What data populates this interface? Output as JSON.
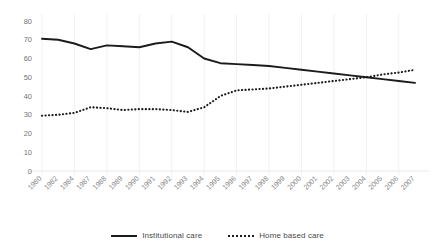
{
  "chart_data": {
    "type": "line",
    "title": "",
    "xlabel": "",
    "ylabel": "",
    "ylim": [
      0,
      80
    ],
    "ytick_step": 10,
    "yticks": [
      "80",
      "70",
      "60",
      "50",
      "40",
      "30",
      "20",
      "10",
      "0"
    ],
    "grid": "vertical-only",
    "legend_position": "bottom-center",
    "categories": [
      "1980",
      "1982",
      "1984",
      "1987",
      "1988",
      "1989",
      "1990",
      "1991",
      "1992",
      "1993",
      "1994",
      "1995",
      "1996",
      "1997",
      "1998",
      "1999",
      "2000",
      "2001",
      "2002",
      "2003",
      "2004",
      "2005",
      "2006",
      "2007"
    ],
    "series": [
      {
        "name": "Institutional care",
        "style": "solid",
        "color": "#1b1b1b",
        "values": [
          70.5,
          70.0,
          68.0,
          65.0,
          67.0,
          66.5,
          66.0,
          68.0,
          69.0,
          66.0,
          60.0,
          57.5,
          57.0,
          56.5,
          56.0,
          55.0,
          54.0,
          53.0,
          52.0,
          51.0,
          50.0,
          49.0,
          48.0,
          47.0
        ]
      },
      {
        "name": "Home based care",
        "style": "dotted",
        "color": "#1b1b1b",
        "values": [
          29.5,
          30.0,
          31.0,
          34.0,
          33.5,
          32.5,
          33.0,
          33.0,
          32.5,
          31.5,
          34.0,
          40.0,
          43.0,
          43.5,
          44.0,
          45.0,
          46.0,
          47.0,
          48.0,
          49.0,
          50.0,
          51.5,
          52.5,
          54.0
        ]
      }
    ]
  },
  "legend": {
    "items": [
      {
        "label": "Institutional care",
        "marker": "solid-line-swatch"
      },
      {
        "label": "Home based care",
        "marker": "dotted-line-swatch"
      }
    ]
  }
}
